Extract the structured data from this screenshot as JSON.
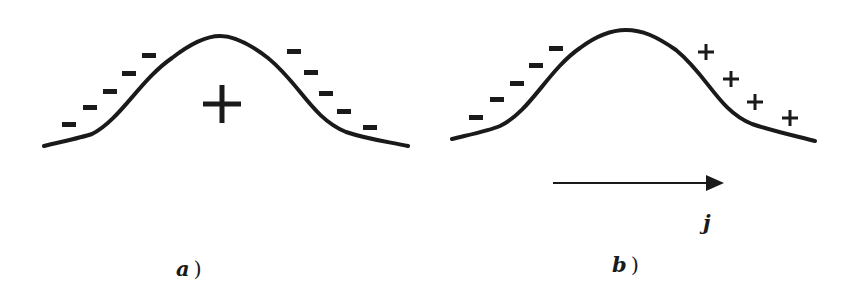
{
  "panels": [
    {
      "id": "a",
      "label": "a",
      "paren": ")",
      "left_charges": [
        "−",
        "−",
        "−",
        "−",
        "−"
      ],
      "right_charges": [
        "−",
        "−",
        "−",
        "−",
        "−"
      ],
      "center_charge": "+"
    },
    {
      "id": "b",
      "label": "b",
      "paren": ")",
      "left_charges": [
        "−",
        "−",
        "−",
        "−",
        "−"
      ],
      "right_charges": [
        "+",
        "+",
        "+",
        "+"
      ],
      "arrow_label": "j"
    }
  ],
  "colors": {
    "ink": "#1a1a1a",
    "background": "#ffffff"
  }
}
